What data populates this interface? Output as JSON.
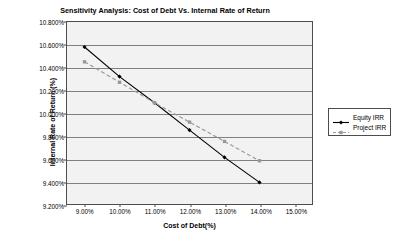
{
  "chart_data": {
    "type": "line",
    "title": "Sensitivity Analysis: Cost of Debt Vs. Internal Rate of Return",
    "xlabel": "Cost of Debt(%)",
    "ylabel": "Internal Rate of Return (%)",
    "x": [
      9.0,
      10.0,
      11.0,
      12.0,
      13.0,
      14.0
    ],
    "x_tick_labels": [
      "9.00%",
      "10.00%",
      "11.00%",
      "12.00%",
      "13.00%",
      "14.00%",
      "15.00%"
    ],
    "x_tick_values": [
      9.0,
      10.0,
      11.0,
      12.0,
      13.0,
      14.0,
      15.0
    ],
    "xlim": [
      8.5,
      15.5
    ],
    "y_tick_labels": [
      "9.200%",
      "9.400%",
      "9.600%",
      "9.800%",
      "10.000%",
      "10.200%",
      "10.400%",
      "10.600%",
      "10.800%"
    ],
    "y_tick_values": [
      9.2,
      9.4,
      9.6,
      9.8,
      10.0,
      10.2,
      10.4,
      10.6,
      10.8
    ],
    "ylim": [
      9.2,
      10.8
    ],
    "grid": true,
    "legend_position": "right",
    "series": [
      {
        "name": "Equity IRR",
        "values": [
          10.58,
          10.32,
          10.09,
          9.85,
          9.61,
          9.39
        ],
        "color": "#000000",
        "line_style": "solid",
        "marker": "diamond"
      },
      {
        "name": "Project IRR",
        "values": [
          10.45,
          10.27,
          10.09,
          9.92,
          9.75,
          9.58
        ],
        "color": "#999999",
        "line_style": "dashed",
        "marker": "square"
      }
    ]
  },
  "legend": {
    "entries": [
      {
        "label": "Equity IRR"
      },
      {
        "label": "Project IRR"
      }
    ]
  },
  "colors": {
    "plot_background": "#f2f2f2",
    "gridline": "#808080",
    "axis": "#4d4d4d",
    "series_1": "#000000",
    "series_2": "#999999"
  }
}
